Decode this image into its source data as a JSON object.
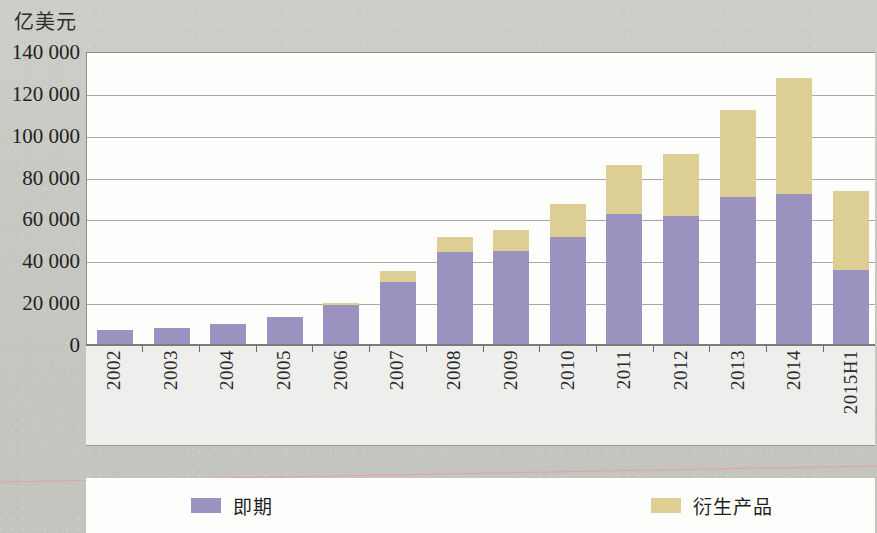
{
  "chart_data": {
    "type": "bar",
    "stacked": true,
    "title": "",
    "subtitle": "",
    "unit_label": "亿美元",
    "xlabel": "",
    "ylabel": "",
    "ylim": [
      0,
      140000
    ],
    "ytick_step": 20000,
    "ytick_labels": [
      "140 000",
      "120 000",
      "100 000",
      "80 000",
      "60 000",
      "40 000",
      "20 000",
      "0"
    ],
    "ytick_values": [
      140000,
      120000,
      100000,
      80000,
      60000,
      40000,
      20000,
      0
    ],
    "grid": true,
    "legend_position": "bottom",
    "categories": [
      "2002",
      "2003",
      "2004",
      "2005",
      "2006",
      "2007",
      "2008",
      "2009",
      "2010",
      "2011",
      "2012",
      "2013",
      "2014",
      "2015H1"
    ],
    "series": [
      {
        "name": "即期",
        "color": "#9b92c0",
        "values": [
          7000,
          8000,
          10000,
          13500,
          19000,
          30000,
          44500,
          45000,
          51500,
          62500,
          61500,
          70500,
          72000,
          36000
        ]
      },
      {
        "name": "衍生产品",
        "color": "#ddcf93",
        "values": [
          0,
          0,
          0,
          0,
          1000,
          5500,
          7000,
          10000,
          16000,
          23500,
          30000,
          42000,
          55500,
          37500
        ]
      }
    ],
    "totals": [
      7000,
      8000,
      10000,
      13500,
      20000,
      35500,
      51500,
      55000,
      67500,
      86000,
      91500,
      112500,
      127500,
      73500
    ]
  },
  "legend": {
    "items": [
      {
        "label": "即期",
        "color": "#9b92c0"
      },
      {
        "label": "衍生产品",
        "color": "#ddcf93"
      }
    ]
  }
}
